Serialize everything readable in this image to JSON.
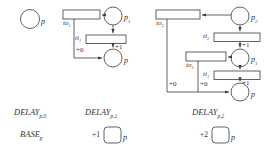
{
  "diagram": {
    "stroke_color": "#3a3a3a",
    "fill_color": "#ffffff",
    "places": [
      {
        "id": "p_base",
        "label": "p",
        "sub": ""
      },
      {
        "id": "p_left1",
        "label": "p",
        "sub": "1"
      },
      {
        "id": "p_left2",
        "label": "p",
        "sub": ""
      },
      {
        "id": "p_r_top",
        "label": "p",
        "sub": "2"
      },
      {
        "id": "p_r_mid",
        "label": "p",
        "sub": "1"
      },
      {
        "id": "p_r_bot",
        "label": "p",
        "sub": ""
      }
    ],
    "transitions": [
      {
        "id": "to1_left",
        "label": "to",
        "sub": "1"
      },
      {
        "id": "ti1_left",
        "label": "ti",
        "sub": "1"
      },
      {
        "id": "to2_right",
        "label": "to",
        "sub": "2"
      },
      {
        "id": "ti2_right",
        "label": "ti",
        "sub": "2"
      },
      {
        "id": "to1_right",
        "label": "to",
        "sub": "1"
      },
      {
        "id": "ti1_right",
        "label": "ti",
        "sub": "1"
      }
    ],
    "arc_weights": [
      {
        "id": "w_left_plus0",
        "text": "+0"
      },
      {
        "id": "w_left_plus1",
        "text": "+1"
      },
      {
        "id": "w_right_plus1_top",
        "text": "+1"
      },
      {
        "id": "w_right_plus1_bot",
        "text": "+1"
      },
      {
        "id": "w_right_plus0_outer",
        "text": "+0"
      },
      {
        "id": "w_right_plus0_inner",
        "text": "+0"
      }
    ]
  },
  "legend": {
    "base": {
      "delay_label": "DELAY",
      "delay_sub": "p,0",
      "base_label": "BASE",
      "base_sub": "p"
    },
    "delay1": {
      "delay_label": "DELAY",
      "delay_sub": "p,1",
      "weight": "+1",
      "place_label": "p"
    },
    "delay2": {
      "delay_label": "DELAY",
      "delay_sub": "p,2",
      "weight": "+2",
      "place_label": "p"
    }
  }
}
